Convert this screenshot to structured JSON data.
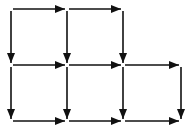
{
  "diagram": {
    "type": "directed-grid",
    "stroke_color": "#111111",
    "background": "#ffffff",
    "nodes": {
      "columns_x": [
        11,
        67,
        123,
        181
      ],
      "rows_y": [
        9,
        65,
        121
      ]
    },
    "edges": [
      {
        "id": "h-r0-c0",
        "from": [
          0,
          0
        ],
        "to": [
          1,
          0
        ],
        "direction": "right"
      },
      {
        "id": "h-r0-c1",
        "from": [
          1,
          0
        ],
        "to": [
          2,
          0
        ],
        "direction": "right"
      },
      {
        "id": "v-r0-c0",
        "from": [
          0,
          0
        ],
        "to": [
          0,
          1
        ],
        "direction": "down"
      },
      {
        "id": "v-r0-c1",
        "from": [
          1,
          0
        ],
        "to": [
          1,
          1
        ],
        "direction": "down"
      },
      {
        "id": "v-r0-c2",
        "from": [
          2,
          0
        ],
        "to": [
          2,
          1
        ],
        "direction": "down"
      },
      {
        "id": "h-r1-c0",
        "from": [
          0,
          1
        ],
        "to": [
          1,
          1
        ],
        "direction": "right"
      },
      {
        "id": "h-r1-c1",
        "from": [
          1,
          1
        ],
        "to": [
          2,
          1
        ],
        "direction": "right"
      },
      {
        "id": "h-r1-c2",
        "from": [
          2,
          1
        ],
        "to": [
          3,
          1
        ],
        "direction": "right"
      },
      {
        "id": "v-r1-c0",
        "from": [
          0,
          1
        ],
        "to": [
          0,
          2
        ],
        "direction": "down"
      },
      {
        "id": "v-r1-c1",
        "from": [
          1,
          1
        ],
        "to": [
          1,
          2
        ],
        "direction": "down"
      },
      {
        "id": "v-r1-c2",
        "from": [
          2,
          1
        ],
        "to": [
          2,
          2
        ],
        "direction": "down"
      },
      {
        "id": "v-r1-c3",
        "from": [
          3,
          1
        ],
        "to": [
          3,
          2
        ],
        "direction": "down"
      },
      {
        "id": "h-r2-c0",
        "from": [
          0,
          2
        ],
        "to": [
          1,
          2
        ],
        "direction": "right"
      },
      {
        "id": "h-r2-c1",
        "from": [
          1,
          2
        ],
        "to": [
          2,
          2
        ],
        "direction": "right"
      },
      {
        "id": "h-r2-c2",
        "from": [
          2,
          2
        ],
        "to": [
          3,
          2
        ],
        "direction": "right"
      }
    ]
  }
}
